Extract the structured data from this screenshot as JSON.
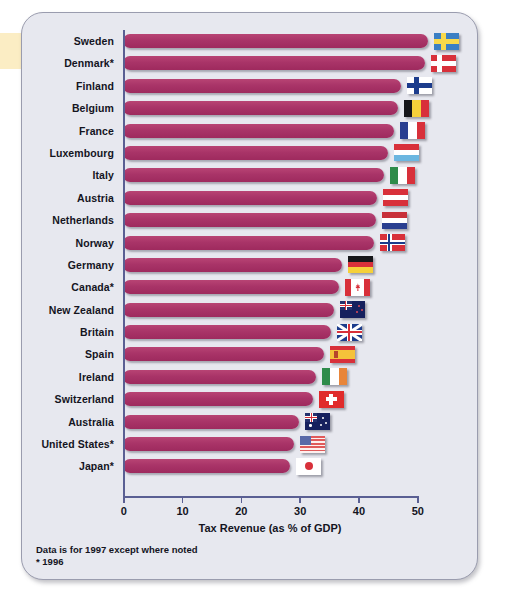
{
  "chart_data": {
    "type": "bar",
    "orientation": "horizontal",
    "title": "",
    "xlabel": "Tax Revenue (as % of GDP)",
    "ylabel": "",
    "xlim": [
      0,
      50
    ],
    "xticks": [
      0,
      10,
      20,
      30,
      40,
      50
    ],
    "grid": false,
    "legend": "none",
    "bar_color": "#a93468",
    "categories": [
      "Sweden",
      "Denmark*",
      "Finland",
      "Belgium",
      "France",
      "Luxembourg",
      "Italy",
      "Austria",
      "Netherlands",
      "Norway",
      "Germany",
      "Canada*",
      "New Zealand",
      "Britain",
      "Spain",
      "Ireland",
      "Switzerland",
      "Australia",
      "United States*",
      "Japan*"
    ],
    "values": [
      51.9,
      51.3,
      47.3,
      46.8,
      46.1,
      45.0,
      44.4,
      43.2,
      43.0,
      42.7,
      37.2,
      36.8,
      35.8,
      35.3,
      34.2,
      32.8,
      32.3,
      30.0,
      29.1,
      28.4
    ],
    "series": [
      {
        "name": "Tax Revenue (% of GDP)",
        "points": [
          {
            "country": "Sweden",
            "value": 51.9,
            "flag": "flag-sweden"
          },
          {
            "country": "Denmark*",
            "value": 51.3,
            "flag": "flag-denmark"
          },
          {
            "country": "Finland",
            "value": 47.3,
            "flag": "flag-finland"
          },
          {
            "country": "Belgium",
            "value": 46.8,
            "flag": "flag-belgium"
          },
          {
            "country": "France",
            "value": 46.1,
            "flag": "flag-france"
          },
          {
            "country": "Luxembourg",
            "value": 45.0,
            "flag": "flag-luxembourg"
          },
          {
            "country": "Italy",
            "value": 44.4,
            "flag": "flag-italy"
          },
          {
            "country": "Austria",
            "value": 43.2,
            "flag": "flag-austria"
          },
          {
            "country": "Netherlands",
            "value": 43.0,
            "flag": "flag-netherlands"
          },
          {
            "country": "Norway",
            "value": 42.7,
            "flag": "flag-norway"
          },
          {
            "country": "Germany",
            "value": 37.2,
            "flag": "flag-germany"
          },
          {
            "country": "Canada*",
            "value": 36.8,
            "flag": "flag-canada"
          },
          {
            "country": "New Zealand",
            "value": 35.8,
            "flag": "flag-new-zealand"
          },
          {
            "country": "Britain",
            "value": 35.3,
            "flag": "flag-britain"
          },
          {
            "country": "Spain",
            "value": 34.2,
            "flag": "flag-spain"
          },
          {
            "country": "Ireland",
            "value": 32.8,
            "flag": "flag-ireland"
          },
          {
            "country": "Switzerland",
            "value": 32.3,
            "flag": "flag-switzerland"
          },
          {
            "country": "Australia",
            "value": 30.0,
            "flag": "flag-australia"
          },
          {
            "country": "United States*",
            "value": 29.1,
            "flag": "flag-united-states"
          },
          {
            "country": "Japan*",
            "value": 28.4,
            "flag": "flag-japan"
          }
        ]
      }
    ],
    "annotations": [
      "Data is for 1997 except where noted",
      "* 1996"
    ]
  },
  "footnotes": {
    "line1": "Data is for 1997 except where noted",
    "line2": "* 1996"
  },
  "colors": {
    "bar": "#a93468",
    "axis": "#5a5f93",
    "panel_background": "#e7e8ef",
    "panel_border": "#9a9cae",
    "text": "#14141e",
    "left_tab": "#fbedc4"
  }
}
